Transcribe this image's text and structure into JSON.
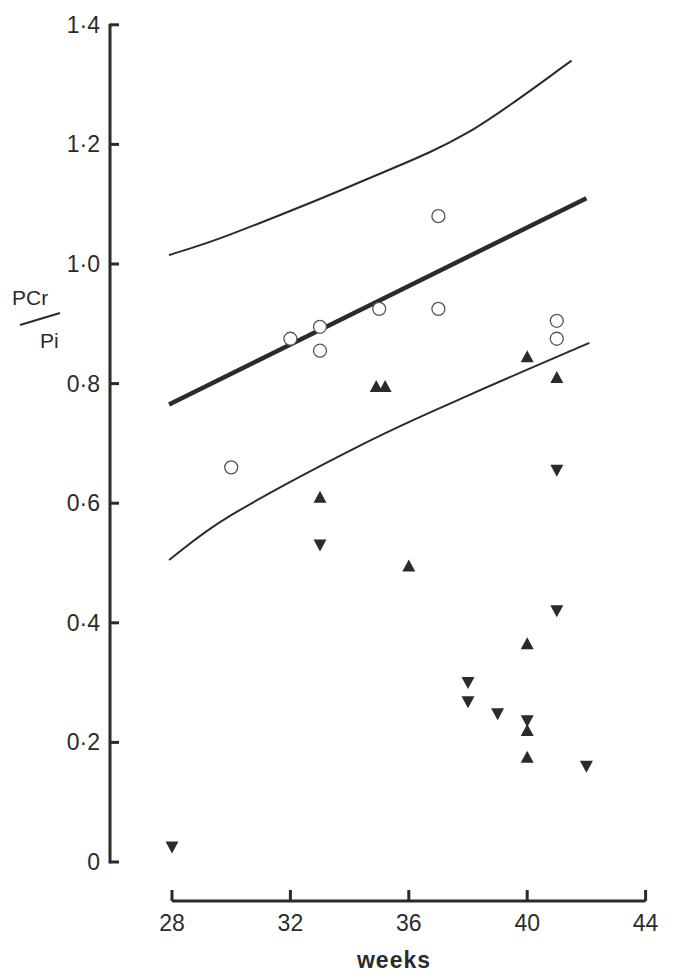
{
  "chart_data": {
    "type": "scatter",
    "title": "",
    "xlabel": "weeks",
    "ylabel_numerator": "PCr",
    "ylabel_denominator": "Pi",
    "ylabel": "PCr/Pi",
    "xlim": [
      28,
      44
    ],
    "ylim": [
      0,
      1.4
    ],
    "x_ticks": [
      28,
      32,
      36,
      40,
      44
    ],
    "x_tick_labels": [
      "28",
      "32",
      "36",
      "40",
      "44"
    ],
    "y_ticks": [
      0,
      0.2,
      0.4,
      0.6,
      0.8,
      1.0,
      1.2,
      1.4
    ],
    "y_tick_labels": [
      "0",
      "0·2",
      "0·4",
      "0·6",
      "0·8",
      "1·0",
      "1·2",
      "1·4"
    ],
    "grid": false,
    "legend": null,
    "series": [
      {
        "name": "open circles",
        "marker": "circle-open",
        "points": [
          {
            "x": 30,
            "y": 0.66
          },
          {
            "x": 32,
            "y": 0.875
          },
          {
            "x": 33,
            "y": 0.895
          },
          {
            "x": 33,
            "y": 0.855
          },
          {
            "x": 35,
            "y": 0.925
          },
          {
            "x": 37,
            "y": 1.08
          },
          {
            "x": 37,
            "y": 0.925
          },
          {
            "x": 41,
            "y": 0.905
          },
          {
            "x": 41,
            "y": 0.875
          }
        ]
      },
      {
        "name": "filled up-triangles",
        "marker": "triangle-up-filled",
        "points": [
          {
            "x": 33,
            "y": 0.61
          },
          {
            "x": 34.9,
            "y": 0.795
          },
          {
            "x": 35.2,
            "y": 0.795
          },
          {
            "x": 36,
            "y": 0.495
          },
          {
            "x": 40,
            "y": 0.845
          },
          {
            "x": 40,
            "y": 0.365
          },
          {
            "x": 40,
            "y": 0.22
          },
          {
            "x": 40,
            "y": 0.175
          },
          {
            "x": 41,
            "y": 0.81
          }
        ]
      },
      {
        "name": "filled down-triangles",
        "marker": "triangle-down-filled",
        "points": [
          {
            "x": 28,
            "y": 0.025
          },
          {
            "x": 33,
            "y": 0.53
          },
          {
            "x": 38,
            "y": 0.3
          },
          {
            "x": 38,
            "y": 0.268
          },
          {
            "x": 39,
            "y": 0.248
          },
          {
            "x": 40,
            "y": 0.236
          },
          {
            "x": 41,
            "y": 0.655
          },
          {
            "x": 41,
            "y": 0.42
          },
          {
            "x": 42,
            "y": 0.16
          }
        ]
      }
    ],
    "lines": [
      {
        "name": "mean regression line",
        "style": "thick",
        "points": [
          {
            "x": 27.9,
            "y": 0.765
          },
          {
            "x": 42.0,
            "y": 1.11
          }
        ]
      },
      {
        "name": "upper bound",
        "style": "thin",
        "points": [
          {
            "x": 27.9,
            "y": 1.015
          },
          {
            "x": 30,
            "y": 1.05
          },
          {
            "x": 34.5,
            "y": 1.14
          },
          {
            "x": 38,
            "y": 1.22
          },
          {
            "x": 41.5,
            "y": 1.34
          }
        ]
      },
      {
        "name": "lower bound",
        "style": "thin",
        "points": [
          {
            "x": 27.9,
            "y": 0.505
          },
          {
            "x": 30,
            "y": 0.58
          },
          {
            "x": 34.5,
            "y": 0.7
          },
          {
            "x": 38,
            "y": 0.78
          },
          {
            "x": 42.1,
            "y": 0.868
          }
        ]
      }
    ]
  },
  "colors": {
    "ink": "#2b2b2b",
    "background": "#ffffff"
  }
}
